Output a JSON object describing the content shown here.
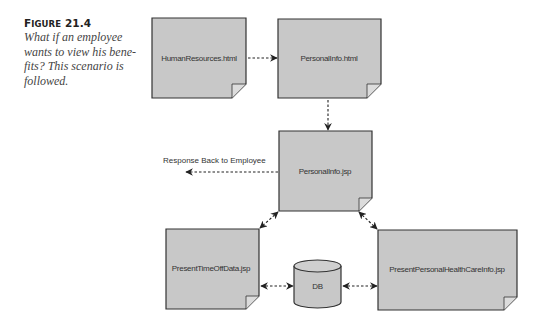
{
  "figure": {
    "number_prefix": "F",
    "number_prefix_rest": "IGURE",
    "number": " 21.4",
    "caption_lines": [
      "What if an employee",
      "wants to view his bene-",
      "fits? This scenario is",
      "followed."
    ]
  },
  "diagram": {
    "fill_color": "#c8c8c8",
    "stroke_color": "#333333",
    "nodes": [
      {
        "id": "human-resources-html",
        "label": "HumanResources.html",
        "shape": "document"
      },
      {
        "id": "personal-info-html",
        "label": "PersonalInfo.html",
        "shape": "document"
      },
      {
        "id": "personal-info-jsp",
        "label": "PersonalInfo.jsp",
        "shape": "document"
      },
      {
        "id": "present-time-off-data-jsp",
        "label": "PresentTimeOffData.jsp",
        "shape": "document"
      },
      {
        "id": "db",
        "label": "DB",
        "shape": "cylinder"
      },
      {
        "id": "present-personal-health-care-info-jsp",
        "label": "PresentPersonalHealthCareInfo.jsp",
        "shape": "document"
      }
    ],
    "edges": [
      {
        "from": "HumanResources.html",
        "to": "PersonalInfo.html",
        "style": "dashed",
        "direction": "forward"
      },
      {
        "from": "PersonalInfo.html",
        "to": "PersonalInfo.jsp",
        "style": "dashed",
        "direction": "forward"
      },
      {
        "from": "PersonalInfo.jsp",
        "to": "Response Back to Employee",
        "style": "dashed",
        "direction": "forward"
      },
      {
        "from": "PersonalInfo.jsp",
        "to": "PresentTimeOffData.jsp",
        "style": "dashed",
        "direction": "both"
      },
      {
        "from": "PersonalInfo.jsp",
        "to": "PresentPersonalHealthCareInfo.jsp",
        "style": "dashed",
        "direction": "both"
      },
      {
        "from": "PresentTimeOffData.jsp",
        "to": "DB",
        "style": "dashed",
        "direction": "both"
      },
      {
        "from": "DB",
        "to": "PresentPersonalHealthCareInfo.jsp",
        "style": "dashed",
        "direction": "both"
      }
    ],
    "response_label": "Response Back to Employee"
  }
}
